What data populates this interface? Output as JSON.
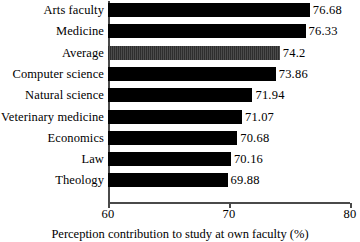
{
  "chart_data": {
    "type": "bar",
    "orientation": "horizontal",
    "title": "",
    "xlabel": "Perception contribution to study at own faculty (%)",
    "ylabel": "",
    "xlim": [
      60,
      80
    ],
    "xticks": [
      "60",
      "70",
      "80"
    ],
    "grid": false,
    "legend": null,
    "categories": [
      "Arts faculty",
      "Medicine",
      "Average",
      "Computer science",
      "Natural science",
      "Veterinary medicine",
      "Economics",
      "Law",
      "Theology"
    ],
    "values": [
      76.68,
      76.33,
      74.2,
      73.86,
      71.94,
      71.07,
      70.68,
      70.16,
      69.88
    ],
    "value_labels": [
      "76.68",
      "76.33",
      "74.2",
      "73.86",
      "71.94",
      "71.07",
      "70.68",
      "70.16",
      "69.88"
    ],
    "highlight_index": 2,
    "colors": {
      "bar": "#000000",
      "highlight_bar": "#3a3a3a",
      "axis": "#4a4a4a",
      "text": "#000000",
      "background": "#ffffff"
    }
  }
}
